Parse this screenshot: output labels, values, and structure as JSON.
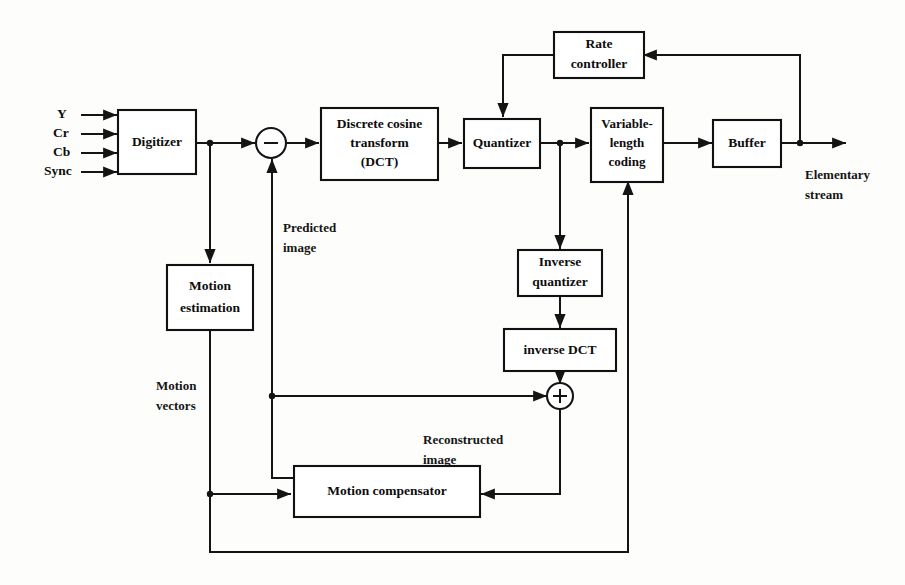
{
  "diagram": {
    "background_color": "#fdfdfc",
    "line_color": "#141414",
    "blocks": [
      {
        "id": "digitizer",
        "label": "Digitizer"
      },
      {
        "id": "dct_line1",
        "label": "Discrete cosine"
      },
      {
        "id": "dct_line2",
        "label": "transform"
      },
      {
        "id": "dct_line3",
        "label": "(DCT)"
      },
      {
        "id": "quantizer",
        "label": "Quantizer"
      },
      {
        "id": "vlc_line1",
        "label": "Variable-"
      },
      {
        "id": "vlc_line2",
        "label": "length"
      },
      {
        "id": "vlc_line3",
        "label": "coding"
      },
      {
        "id": "buffer",
        "label": "Buffer"
      },
      {
        "id": "rate_line1",
        "label": "Rate"
      },
      {
        "id": "rate_line2",
        "label": "controller"
      },
      {
        "id": "invq_line1",
        "label": "Inverse"
      },
      {
        "id": "invq_line2",
        "label": "quantizer"
      },
      {
        "id": "invdct",
        "label": "inverse DCT"
      },
      {
        "id": "motion_est_line1",
        "label": "Motion"
      },
      {
        "id": "motion_est_line2",
        "label": "estimation"
      },
      {
        "id": "motion_comp",
        "label": "Motion compensator"
      }
    ],
    "inputs": [
      {
        "id": "input_y",
        "label": "Y"
      },
      {
        "id": "input_cr",
        "label": "Cr"
      },
      {
        "id": "input_cb",
        "label": "Cb"
      },
      {
        "id": "input_sync",
        "label": "Sync"
      }
    ],
    "outputs": [
      {
        "id": "output_stream_line1",
        "label": "Elementary"
      },
      {
        "id": "output_stream_line2",
        "label": "stream"
      }
    ],
    "annotations": [
      {
        "id": "predicted_line1",
        "label": "Predicted"
      },
      {
        "id": "predicted_line2",
        "label": "image"
      },
      {
        "id": "motion_vec_line1",
        "label": "Motion"
      },
      {
        "id": "motion_vec_line2",
        "label": "vectors"
      },
      {
        "id": "reconstructed_line1",
        "label": "Reconstructed"
      },
      {
        "id": "reconstructed_line2",
        "label": "image"
      }
    ],
    "operators": [
      {
        "id": "subtractor",
        "symbol": "−"
      },
      {
        "id": "adder",
        "symbol": "+"
      }
    ]
  }
}
